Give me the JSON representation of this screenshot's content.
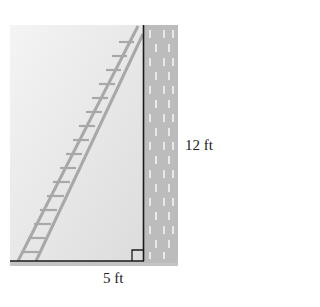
{
  "diagram": {
    "type": "right-triangle-ladder-against-wall",
    "labels": {
      "height": "12 ft",
      "base": "5 ft"
    },
    "colors": {
      "background_fill": "#e4e4e4",
      "wall": "#b9b9b9",
      "brick_mark": "#f2f2f2",
      "ladder": "#a8a8a8",
      "lines": "#1a1a1a"
    }
  }
}
